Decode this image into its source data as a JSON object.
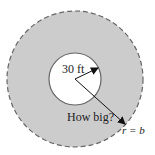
{
  "diagram": {
    "type": "concentric-circles",
    "outer_circle": {
      "cx": 75,
      "cy": 79,
      "r": 68,
      "fill": "#cccccc",
      "stroke": "#666666",
      "stroke_style": "dashed"
    },
    "inner_circle": {
      "cx": 75,
      "cy": 79,
      "r": 26,
      "fill": "#ffffff",
      "stroke": "#666666"
    },
    "labels": {
      "inner_radius": "30 ft",
      "question": "How big?",
      "outer_radius": "r = b"
    },
    "colors": {
      "ring_fill": "#cccccc",
      "inner_fill": "#ffffff",
      "stroke": "#666666",
      "arrow": "#111111"
    }
  }
}
